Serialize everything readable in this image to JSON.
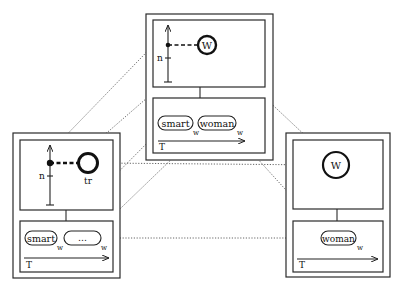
{
  "diagram": {
    "colors": {
      "line": "#2a2a2a",
      "dotted": "#555555",
      "background": "#ffffff"
    },
    "top_frame": {
      "circle_label": "W",
      "axis_label": "n",
      "words": [
        {
          "text": "smart",
          "subscript": "w"
        },
        {
          "text": "woman",
          "subscript": "w"
        }
      ],
      "timeline_label": "T"
    },
    "left_frame": {
      "circle_label": "tr",
      "axis_label": "n",
      "words": [
        {
          "text": "smart",
          "subscript": "w"
        },
        {
          "text": "…",
          "subscript": "w"
        }
      ],
      "timeline_label": "T"
    },
    "right_frame": {
      "circle_label": "W",
      "words": [
        {
          "text": "woman",
          "subscript": "w"
        }
      ],
      "timeline_label": "T"
    }
  }
}
